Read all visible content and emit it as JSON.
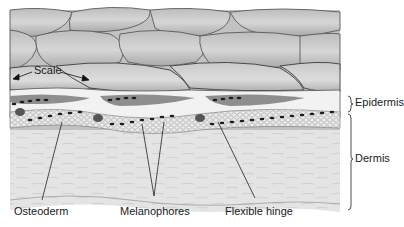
{
  "diagram": {
    "labels": {
      "scale": "Scale",
      "epidermis": "Epidermis",
      "dermis": "Dermis",
      "osteoderm": "Osteoderm",
      "melanophores": "Melanophores",
      "flexible_hinge": "Flexible hinge"
    }
  }
}
